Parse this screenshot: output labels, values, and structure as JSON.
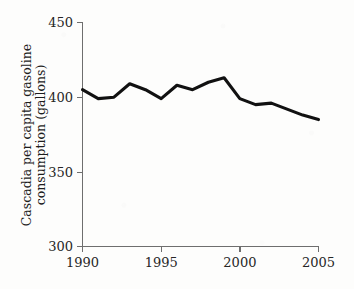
{
  "chart_data": {
    "type": "line",
    "title": "",
    "xlabel": "",
    "ylabel": "Cascadia per capita gasoline consumption (gallons)",
    "ylabel_line1": "Cascadia per capita gasoline",
    "ylabel_line2": "consumption (gallons)",
    "x": [
      1990,
      1991,
      1992,
      1993,
      1994,
      1995,
      1996,
      1997,
      1998,
      1999,
      2000,
      2001,
      2002,
      2003,
      2004,
      2005
    ],
    "values": [
      405,
      399,
      400,
      409,
      405,
      399,
      408,
      405,
      410,
      413,
      399,
      395,
      396,
      392,
      388,
      385
    ],
    "series": [
      {
        "name": "Cascadia per capita gasoline consumption",
        "values": [
          405,
          399,
          400,
          409,
          405,
          399,
          408,
          405,
          410,
          413,
          399,
          395,
          396,
          392,
          388,
          385
        ]
      }
    ],
    "xlim": [
      1990,
      2005
    ],
    "ylim": [
      300,
      450
    ],
    "y_ticks": [
      300,
      350,
      400,
      450
    ],
    "y_tick_labels": [
      "300",
      "350",
      "400",
      "450"
    ],
    "x_ticks": [
      1990,
      1995,
      2000,
      2005
    ],
    "x_tick_labels": [
      "1990",
      "1995",
      "2000",
      "2005"
    ],
    "grid": false,
    "legend": false,
    "legend_position": "none",
    "line_color": "#111111",
    "axis_color": "#6e6e6e",
    "background_color": "#fdfdfc"
  }
}
